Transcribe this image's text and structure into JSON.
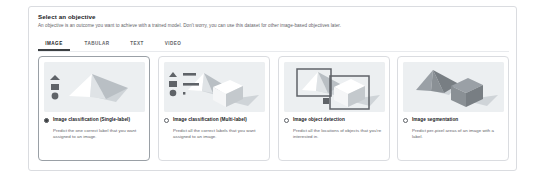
{
  "panel": {
    "title": "Select an objective",
    "subtitle": "An objective is an outcome you want to achieve with a trained model. Don't worry, you can use this dataset for other image-based objectives later."
  },
  "tabs": [
    {
      "label": "IMAGE",
      "active": true,
      "left": 0,
      "width": 32
    },
    {
      "label": "TABULAR",
      "active": false,
      "left": 40,
      "width": 38
    },
    {
      "label": "TEXT",
      "active": false,
      "left": 86,
      "width": 26
    },
    {
      "label": "VIDEO",
      "active": false,
      "left": 120,
      "width": 30
    }
  ],
  "cards": [
    {
      "id": "image-classification-single-label",
      "title": "Image classification (Single-label)",
      "description": "Predict the one correct label that you want assigned to an image.",
      "selected": true,
      "illustration": "pyramid-with-single-label-icons",
      "left": 0
    },
    {
      "id": "image-classification-multi-label",
      "title": "Image classification (Multi-label)",
      "description": "Predict all the correct labels that you want assigned to an image.",
      "selected": false,
      "illustration": "pyramid-and-cube-with-multi-label-icons",
      "left": 120
    },
    {
      "id": "image-object-detection",
      "title": "Image object detection",
      "description": "Predict all the locations of objects that you're interested in.",
      "selected": false,
      "illustration": "pyramid-and-cube-with-bounding-boxes",
      "left": 240
    },
    {
      "id": "image-segmentation",
      "title": "Image segmentation",
      "description": "Predict per-pixel areas of an image with a label.",
      "selected": false,
      "illustration": "pyramid-and-cube-solid-masks",
      "left": 359
    }
  ],
  "colors": {
    "panel_border": "#dadce0",
    "thumb_background": "#eceff1",
    "active_tab_underline": "#3c4043",
    "title_text": "#202124",
    "muted_text": "#5f6368"
  }
}
